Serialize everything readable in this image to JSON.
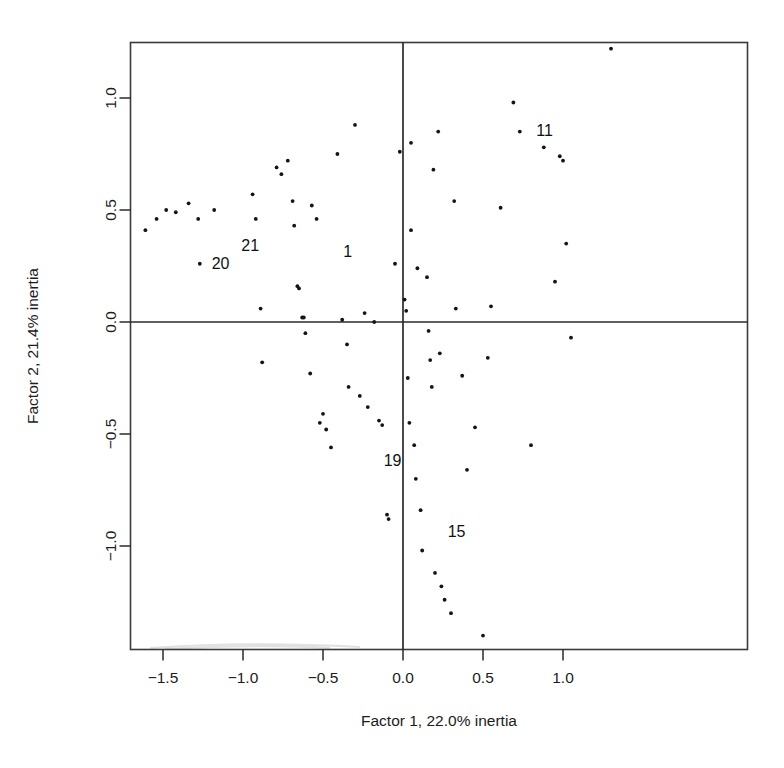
{
  "chart_data": {
    "type": "scatter",
    "title": "",
    "xlabel": "Factor 1, 22.0% inertia",
    "ylabel": "Factor 2, 21.4% inertia",
    "xlim": [
      -1.71,
      1.44
    ],
    "ylim": [
      -1.44,
      1.31
    ],
    "xticks": [
      -1.5,
      -1.0,
      -0.5,
      0.0,
      0.5,
      1.0
    ],
    "xtick_labels": [
      "−1.5",
      "−1.0",
      "−0.5",
      "0.0",
      "0.5",
      "1.0"
    ],
    "yticks": [
      -1.0,
      -0.5,
      0.0,
      0.5,
      1.0
    ],
    "ytick_labels": [
      "−1.0",
      "−0.5",
      "0.0",
      "0.5",
      "1.0"
    ],
    "grid": false,
    "legend": "none",
    "reference_lines": [
      {
        "orientation": "horizontal",
        "value": 0.0
      },
      {
        "orientation": "vertical",
        "value": 0.0
      }
    ],
    "marker": "point",
    "marker_color": "#141414",
    "points": [
      {
        "x": -1.61,
        "y": 0.41
      },
      {
        "x": -1.54,
        "y": 0.46
      },
      {
        "x": -1.48,
        "y": 0.5
      },
      {
        "x": -1.42,
        "y": 0.49
      },
      {
        "x": -1.34,
        "y": 0.53
      },
      {
        "x": -1.28,
        "y": 0.46
      },
      {
        "x": -1.18,
        "y": 0.5
      },
      {
        "x": -1.27,
        "y": 0.26
      },
      {
        "x": -0.94,
        "y": 0.57
      },
      {
        "x": -0.92,
        "y": 0.46
      },
      {
        "x": -0.89,
        "y": 0.06
      },
      {
        "x": -0.88,
        "y": -0.18
      },
      {
        "x": -0.79,
        "y": 0.69
      },
      {
        "x": -0.76,
        "y": 0.66
      },
      {
        "x": -0.72,
        "y": 0.72
      },
      {
        "x": -0.69,
        "y": 0.54
      },
      {
        "x": -0.68,
        "y": 0.43
      },
      {
        "x": -0.66,
        "y": 0.16
      },
      {
        "x": -0.65,
        "y": 0.15
      },
      {
        "x": -0.63,
        "y": 0.02
      },
      {
        "x": -0.62,
        "y": 0.02
      },
      {
        "x": -0.61,
        "y": -0.05
      },
      {
        "x": -0.58,
        "y": -0.23
      },
      {
        "x": -0.57,
        "y": 0.52
      },
      {
        "x": -0.54,
        "y": 0.46
      },
      {
        "x": -0.52,
        "y": -0.45
      },
      {
        "x": -0.5,
        "y": -0.41
      },
      {
        "x": -0.48,
        "y": -0.48
      },
      {
        "x": -0.45,
        "y": -0.56
      },
      {
        "x": -0.41,
        "y": 0.75
      },
      {
        "x": -0.38,
        "y": 0.01
      },
      {
        "x": -0.35,
        "y": -0.1
      },
      {
        "x": -0.34,
        "y": -0.29
      },
      {
        "x": -0.3,
        "y": 0.88
      },
      {
        "x": -0.27,
        "y": -0.33
      },
      {
        "x": -0.24,
        "y": 0.04
      },
      {
        "x": -0.22,
        "y": -0.38
      },
      {
        "x": -0.18,
        "y": 0.0
      },
      {
        "x": -0.15,
        "y": -0.44
      },
      {
        "x": -0.13,
        "y": -0.46
      },
      {
        "x": -0.1,
        "y": -0.86
      },
      {
        "x": -0.09,
        "y": -0.88
      },
      {
        "x": -0.05,
        "y": 0.26
      },
      {
        "x": -0.02,
        "y": 0.76
      },
      {
        "x": 0.01,
        "y": 0.1
      },
      {
        "x": 0.02,
        "y": 0.05
      },
      {
        "x": 0.03,
        "y": -0.25
      },
      {
        "x": 0.04,
        "y": -0.45
      },
      {
        "x": 0.05,
        "y": 0.8
      },
      {
        "x": 0.05,
        "y": 0.41
      },
      {
        "x": 0.07,
        "y": -0.55
      },
      {
        "x": 0.08,
        "y": -0.7
      },
      {
        "x": 0.09,
        "y": 0.24
      },
      {
        "x": 0.11,
        "y": -0.84
      },
      {
        "x": 0.12,
        "y": -1.02
      },
      {
        "x": 0.15,
        "y": 0.2
      },
      {
        "x": 0.16,
        "y": -0.04
      },
      {
        "x": 0.17,
        "y": -0.17
      },
      {
        "x": 0.18,
        "y": -0.29
      },
      {
        "x": 0.19,
        "y": 0.68
      },
      {
        "x": 0.2,
        "y": -1.12
      },
      {
        "x": 0.22,
        "y": 0.85
      },
      {
        "x": 0.23,
        "y": -0.14
      },
      {
        "x": 0.24,
        "y": -1.18
      },
      {
        "x": 0.26,
        "y": -1.24
      },
      {
        "x": 0.3,
        "y": -1.3
      },
      {
        "x": 0.32,
        "y": 0.54
      },
      {
        "x": 0.33,
        "y": 0.06
      },
      {
        "x": 0.37,
        "y": -0.24
      },
      {
        "x": 0.4,
        "y": -0.66
      },
      {
        "x": 0.45,
        "y": -0.47
      },
      {
        "x": 0.5,
        "y": -1.4
      },
      {
        "x": 0.53,
        "y": -0.16
      },
      {
        "x": 0.55,
        "y": 0.07
      },
      {
        "x": 0.61,
        "y": 0.51
      },
      {
        "x": 0.69,
        "y": 0.98
      },
      {
        "x": 0.73,
        "y": 0.85
      },
      {
        "x": 0.8,
        "y": -0.55
      },
      {
        "x": 0.88,
        "y": 0.78
      },
      {
        "x": 0.95,
        "y": 0.18
      },
      {
        "x": 0.98,
        "y": 0.74
      },
      {
        "x": 1.0,
        "y": 0.72
      },
      {
        "x": 1.02,
        "y": 0.35
      },
      {
        "x": 1.05,
        "y": -0.07
      },
      {
        "x": 1.3,
        "y": 1.22
      }
    ],
    "annotations": [
      {
        "text": "20",
        "x": -1.14,
        "y": 0.265
      },
      {
        "text": "21",
        "x": -0.955,
        "y": 0.345
      },
      {
        "text": "1",
        "x": -0.345,
        "y": 0.315
      },
      {
        "text": "11",
        "x": 0.885,
        "y": 0.855
      },
      {
        "text": "15",
        "x": 0.335,
        "y": -0.935
      },
      {
        "text": "19",
        "x": -0.065,
        "y": -0.615
      }
    ]
  }
}
